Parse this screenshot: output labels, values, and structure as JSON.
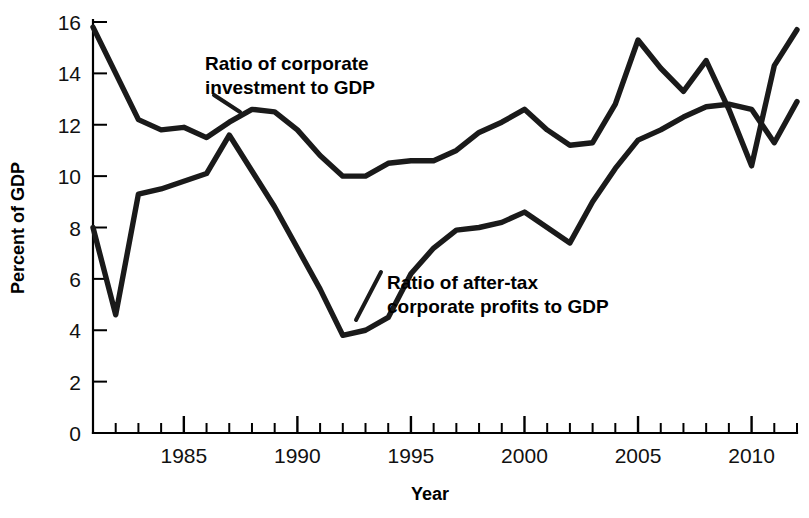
{
  "chart_data": {
    "type": "line",
    "title": "",
    "xlabel": "Year",
    "ylabel": "Percent of GDP",
    "xlim": [
      1981,
      2012
    ],
    "ylim": [
      0,
      16
    ],
    "ytick_step": 2,
    "yticks": [
      "0",
      "2",
      "4",
      "6",
      "8",
      "10",
      "12",
      "14",
      "16"
    ],
    "xticks_major": [
      "1985",
      "1990",
      "1995",
      "2000",
      "2005",
      "2010"
    ],
    "xtick_minor_interval": 1,
    "grid": false,
    "legend": "inline-annotations",
    "x": [
      1981,
      1982,
      1983,
      1984,
      1985,
      1986,
      1987,
      1988,
      1989,
      1990,
      1991,
      1992,
      1993,
      1994,
      1995,
      1996,
      1997,
      1998,
      1999,
      2000,
      2001,
      2002,
      2003,
      2004,
      2005,
      2006,
      2007,
      2008,
      2009,
      2010,
      2011,
      2012
    ],
    "series": [
      {
        "name": "Ratio of corporate investment to GDP",
        "values": [
          15.8,
          14.0,
          12.2,
          11.8,
          11.9,
          11.5,
          12.1,
          12.6,
          12.5,
          11.8,
          10.8,
          10.0,
          10.0,
          10.5,
          10.6,
          10.6,
          11.0,
          11.7,
          12.1,
          12.6,
          11.8,
          11.2,
          11.3,
          12.8,
          15.3,
          14.2,
          13.3,
          14.5,
          12.6,
          10.4,
          14.3,
          15.7
        ]
      },
      {
        "name": "Ratio of after-tax corporate profits to GDP",
        "values": [
          8.0,
          4.6,
          9.3,
          9.5,
          9.8,
          10.1,
          11.6,
          10.2,
          8.8,
          7.2,
          5.6,
          3.8,
          4.0,
          4.5,
          6.2,
          7.2,
          7.9,
          8.0,
          8.2,
          8.6,
          8.0,
          7.4,
          9.0,
          10.3,
          11.4,
          11.8,
          12.3,
          12.7,
          12.8,
          12.6,
          11.3,
          12.9
        ]
      }
    ],
    "annotations": [
      {
        "id": "investment-annotation",
        "line1": "Ratio of corporate",
        "line2": "investment to GDP"
      },
      {
        "id": "profits-annotation",
        "line1": "Ratio of after-tax",
        "line2": "corporate profits to GDP"
      }
    ],
    "colors": {
      "line": "#1a1a1a",
      "axis": "#000000",
      "background": "#ffffff",
      "text": "#000000"
    }
  }
}
